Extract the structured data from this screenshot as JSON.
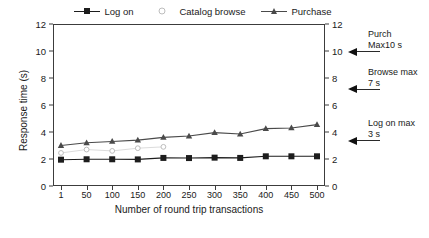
{
  "chart_data": {
    "type": "line",
    "title": "",
    "xlabel": "Number of round trip transactions",
    "ylabel": "Response time (s)",
    "xlim": [
      0,
      10
    ],
    "ylim": [
      0,
      12
    ],
    "grid": false,
    "legend_position": "top",
    "categories": [
      "1",
      "50",
      "100",
      "150",
      "200",
      "250",
      "300",
      "350",
      "400",
      "450",
      "500"
    ],
    "xticklabels": [
      "1",
      "50",
      "100",
      "150",
      "200",
      "250",
      "300",
      "350",
      "400",
      "450",
      "500"
    ],
    "yticks_left": [
      "0",
      "2",
      "4",
      "6",
      "8",
      "10",
      "12"
    ],
    "yticks_right": [
      "0",
      "2",
      "4",
      "6",
      "8",
      "10",
      "12"
    ],
    "series": [
      {
        "name": "Log on",
        "marker": "square",
        "color": "#1d1d1d",
        "values": [
          1.95,
          1.98,
          1.98,
          1.97,
          2.08,
          2.07,
          2.1,
          2.08,
          2.2,
          2.2,
          2.2
        ]
      },
      {
        "name": "Catalog browse",
        "marker": "circle",
        "color": "#bdbdbd",
        "values": [
          2.45,
          2.7,
          2.6,
          2.8,
          2.9,
          null,
          null,
          null,
          null,
          null,
          null
        ]
      },
      {
        "name": "Purchase",
        "marker": "triangle",
        "color": "#4a4a4a",
        "values": [
          3.0,
          3.2,
          3.3,
          3.4,
          3.6,
          3.7,
          3.95,
          3.85,
          4.25,
          4.3,
          4.55
        ]
      }
    ],
    "annotations": [
      {
        "id": "purchase-max",
        "line1": "Purch",
        "line2": "Max10 s",
        "y_value": 10
      },
      {
        "id": "browse-max",
        "line1": "Browse max",
        "line2": "7 s",
        "y_value": 7.2
      },
      {
        "id": "logon-max",
        "line1": "Log on max",
        "line2": "3 s",
        "y_value": 3.4
      }
    ]
  },
  "legend": {
    "entries": [
      {
        "label": "Log on"
      },
      {
        "label": "Catalog browse"
      },
      {
        "label": "Purchase"
      }
    ]
  },
  "caption": {
    "text": ""
  }
}
